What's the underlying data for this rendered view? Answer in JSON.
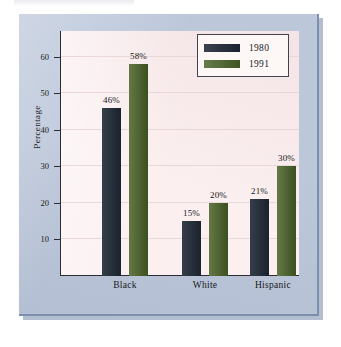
{
  "figure": {
    "panel_bg_color": "#bcc7da",
    "plot_bg_color": "#fbeff0"
  },
  "chart_data": {
    "type": "bar",
    "title": "",
    "xlabel": "",
    "ylabel": "Percentage",
    "categories": [
      "Black",
      "White",
      "Hispanic"
    ],
    "series": [
      {
        "name": "1980",
        "color": "#1e2936",
        "values": [
          46,
          15,
          21
        ],
        "labels": [
          "46%",
          "15%",
          "21%"
        ]
      },
      {
        "name": "1991",
        "color": "#4a6327",
        "values": [
          58,
          20,
          30
        ],
        "labels": [
          "58%",
          "20%",
          "30%"
        ]
      }
    ],
    "ylim": [
      0,
      67
    ],
    "yticks": [
      10,
      20,
      30,
      40,
      50,
      60
    ],
    "ytick_labels": [
      "10",
      "20",
      "30",
      "40",
      "50",
      "60"
    ],
    "grid": true,
    "legend_position": "top-right",
    "legend_entries": [
      "1980",
      "1991"
    ]
  }
}
